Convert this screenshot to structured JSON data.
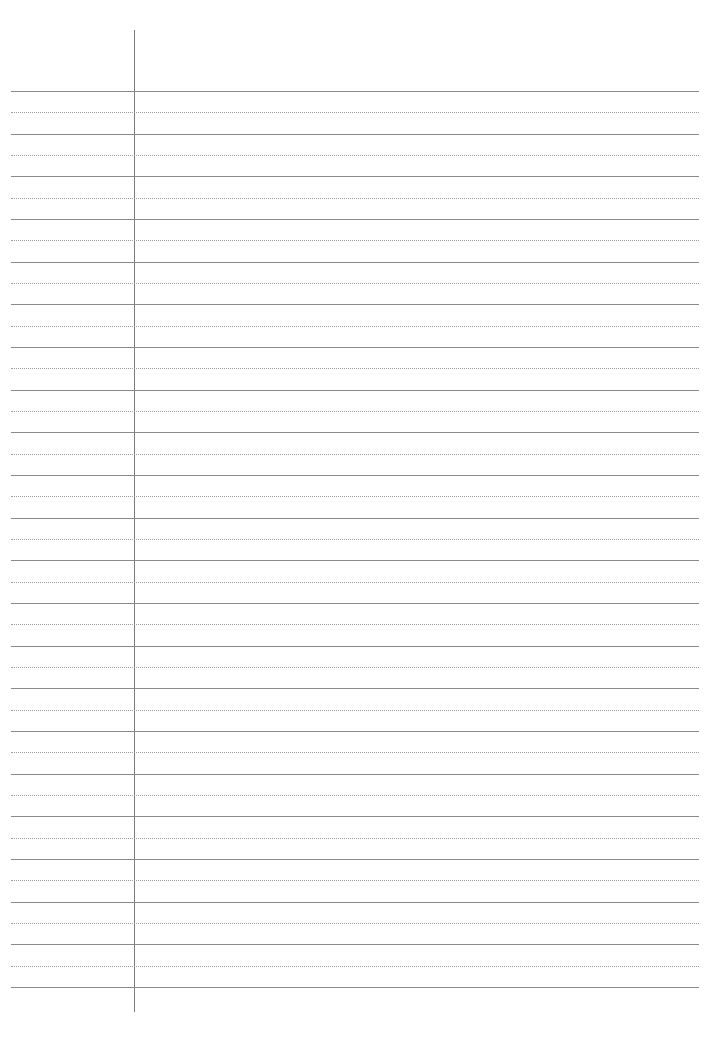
{
  "page": {
    "type": "lined-paper",
    "background_color": "#ffffff",
    "line_color": "#8a8a8a",
    "dotted_line_color": "#9a9a9a",
    "margin_line_color": "#7a7a7a",
    "solid_line_count": 22,
    "dotted_line_count": 21,
    "first_line_y": 91,
    "line_spacing": 42.67
  }
}
